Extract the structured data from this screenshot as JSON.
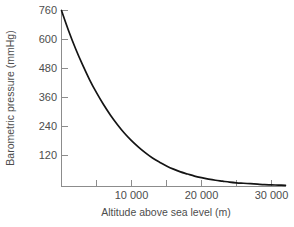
{
  "chart_data": {
    "type": "line",
    "title": "",
    "subtitle": "",
    "xlabel": "Altitude above sea level (m)",
    "ylabel": "Barometric pressure (mmHg)",
    "xlim": [
      0,
      32000
    ],
    "ylim": [
      0,
      800
    ],
    "grid": false,
    "legend": null,
    "x_major_ticks": [
      10000,
      20000,
      30000
    ],
    "x_major_tick_labels": [
      "10 000",
      "20 000",
      "30 000"
    ],
    "x_minor_ticks": [
      5000,
      15000,
      25000
    ],
    "y_ticks": [
      120,
      240,
      360,
      480,
      600,
      760
    ],
    "y_tick_labels": [
      "120",
      "240",
      "360",
      "480",
      "600",
      "760"
    ],
    "series": [
      {
        "name": "Barometric pressure",
        "color": "#141414",
        "x": [
          0,
          1000,
          2000,
          3000,
          4000,
          5000,
          6000,
          7000,
          8000,
          9000,
          10000,
          11000,
          12000,
          13000,
          14000,
          15000,
          16000,
          17000,
          18000,
          19000,
          20000,
          21000,
          22000,
          23000,
          24000,
          25000,
          26000,
          27000,
          28000,
          29000,
          30000,
          31000,
          32000
        ],
        "y": [
          760,
          674,
          596,
          526,
          462,
          405,
          354,
          308,
          267,
          230,
          198,
          170,
          145,
          123,
          105,
          89,
          75,
          63,
          54,
          45,
          38,
          32,
          27,
          23,
          19,
          16,
          14,
          12,
          10,
          8,
          7,
          6,
          5
        ]
      }
    ],
    "annotations": [],
    "axis_color": "#8c8c8c",
    "text_color": "#4d4d4d",
    "background_color": "#ffffff"
  },
  "axes": {
    "y_title": "Barometric pressure (mmHg)",
    "x_title": "Altitude above sea level (m)"
  }
}
